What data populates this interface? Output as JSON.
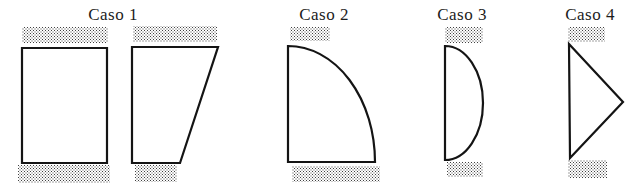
{
  "figure": {
    "cases": [
      {
        "label": "Caso 1",
        "shapes": [
          "rectangle",
          "trapezoid"
        ]
      },
      {
        "label": "Caso 2",
        "shapes": [
          "quarter-ellipse"
        ]
      },
      {
        "label": "Caso 3",
        "shapes": [
          "half-lens"
        ]
      },
      {
        "label": "Caso 4",
        "shapes": [
          "triangle"
        ]
      }
    ]
  },
  "colors": {
    "background": "#ffffff",
    "line": "#141414",
    "text": "#1c1c1c",
    "stipple": "#444444"
  }
}
